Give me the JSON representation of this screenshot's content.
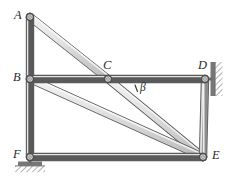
{
  "diagram": {
    "type": "structural-frame",
    "background_color": "#ffffff",
    "member_fill_light": "#e9e9e9",
    "member_fill_mid": "#cfcfcf",
    "member_edge_color": "#5a5a5a",
    "member_highlight": "#fafafa",
    "joint_ring_color": "#555555",
    "joint_fill_color": "#d8d8d8",
    "support_hatch_color": "#6b6b6b",
    "label_color": "#2b2b2b",
    "nodes": [
      {
        "id": "A",
        "label": "A",
        "x": 30,
        "y": 17,
        "label_x": 14,
        "label_y": 9,
        "joint": true
      },
      {
        "id": "B",
        "label": "B",
        "x": 30,
        "y": 79,
        "label_x": 13,
        "label_y": 72,
        "joint": true
      },
      {
        "id": "C",
        "label": "C",
        "x": 108,
        "y": 79,
        "label_x": 103,
        "label_y": 60,
        "joint": true
      },
      {
        "id": "D",
        "label": "D",
        "x": 205,
        "y": 79,
        "label_x": 198,
        "label_y": 60,
        "joint": true
      },
      {
        "id": "E",
        "label": "E",
        "x": 203,
        "y": 157,
        "label_x": 212,
        "label_y": 150,
        "joint": true
      },
      {
        "id": "F",
        "label": "F",
        "x": 30,
        "y": 157,
        "label_x": 13,
        "label_y": 149,
        "joint": true
      }
    ],
    "members": [
      {
        "id": "AB",
        "from": "A",
        "to": "B",
        "name": "member-a-b",
        "width": 6
      },
      {
        "id": "AC",
        "from": "A",
        "to": "C",
        "name": "member-a-c",
        "width": 6
      },
      {
        "id": "BC",
        "from": "B",
        "to": "C",
        "name": "member-b-c",
        "width": 6
      },
      {
        "id": "CD",
        "from": "C",
        "to": "D",
        "name": "member-c-d",
        "width": 6
      },
      {
        "id": "CE",
        "from": "C",
        "to": "E",
        "name": "member-c-e",
        "width": 6
      },
      {
        "id": "BE",
        "from": "B",
        "to": "E",
        "name": "member-b-e",
        "width": 6
      },
      {
        "id": "BF",
        "from": "B",
        "to": "F",
        "name": "member-b-f",
        "width": 6
      },
      {
        "id": "FE",
        "from": "F",
        "to": "E",
        "name": "member-f-e",
        "width": 6
      },
      {
        "id": "DE",
        "from": "D",
        "to": "E",
        "name": "member-d-e",
        "width": 6
      }
    ],
    "angles": [
      {
        "id": "beta",
        "label": "β",
        "at_node": "C",
        "between": "CD-CE",
        "label_x": 141,
        "label_y": 83,
        "tick_x": 135,
        "tick_y": 86
      }
    ],
    "supports": [
      {
        "id": "support-D",
        "node": "D",
        "kind": "wall-pin",
        "orientation": "vertical-wall-right"
      },
      {
        "id": "support-F",
        "node": "F",
        "kind": "ground-pin",
        "orientation": "horizontal-ground-below"
      }
    ]
  }
}
